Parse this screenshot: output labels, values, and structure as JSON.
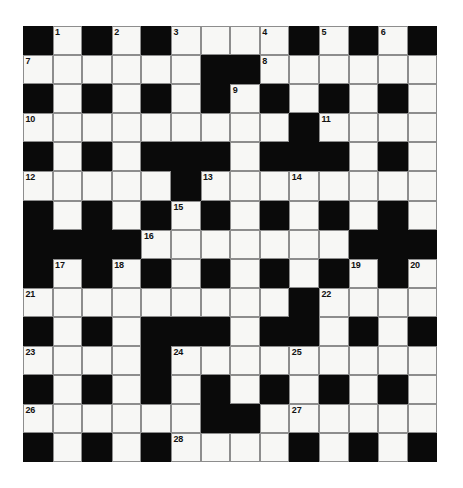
{
  "puzzle": {
    "type": "crossword-grid",
    "title": "",
    "columns": 14,
    "rows": 15,
    "colors": {
      "block": "#0a0a0a",
      "open": "#f7f7f5",
      "grid_line": "#8d8d8d",
      "number_text": "#111111",
      "page_background": "#ffffff"
    },
    "legend": {
      "1": "block (filled black square)",
      "0": "open (white answer square)"
    },
    "grid": [
      [
        1,
        0,
        1,
        0,
        1,
        0,
        0,
        0,
        0,
        1,
        0,
        1,
        0,
        1
      ],
      [
        0,
        0,
        0,
        0,
        0,
        0,
        1,
        1,
        0,
        0,
        0,
        0,
        0,
        0
      ],
      [
        1,
        0,
        1,
        0,
        1,
        0,
        1,
        0,
        1,
        0,
        1,
        0,
        1,
        0
      ],
      [
        0,
        0,
        0,
        0,
        0,
        0,
        0,
        0,
        0,
        1,
        0,
        0,
        0,
        0
      ],
      [
        1,
        0,
        1,
        0,
        1,
        1,
        1,
        0,
        1,
        1,
        1,
        0,
        1,
        0
      ],
      [
        0,
        0,
        0,
        0,
        0,
        1,
        0,
        0,
        0,
        0,
        0,
        0,
        0,
        0
      ],
      [
        1,
        0,
        1,
        0,
        1,
        0,
        1,
        0,
        1,
        0,
        1,
        0,
        1,
        0
      ],
      [
        1,
        1,
        1,
        1,
        0,
        0,
        0,
        0,
        0,
        0,
        0,
        1,
        1,
        1
      ],
      [
        1,
        0,
        1,
        0,
        1,
        0,
        1,
        0,
        1,
        0,
        1,
        0,
        1,
        0
      ],
      [
        0,
        0,
        0,
        0,
        0,
        0,
        0,
        0,
        0,
        1,
        0,
        0,
        0,
        0
      ],
      [
        1,
        0,
        1,
        0,
        1,
        1,
        1,
        0,
        1,
        1,
        0,
        1,
        0,
        1
      ],
      [
        0,
        0,
        0,
        0,
        1,
        0,
        0,
        0,
        0,
        0,
        0,
        0,
        0,
        0
      ],
      [
        1,
        0,
        1,
        0,
        1,
        0,
        1,
        0,
        1,
        0,
        1,
        0,
        1,
        0
      ],
      [
        0,
        0,
        0,
        0,
        0,
        0,
        1,
        1,
        0,
        0,
        0,
        0,
        0,
        0
      ],
      [
        1,
        0,
        1,
        0,
        1,
        0,
        0,
        0,
        0,
        1,
        0,
        1,
        0,
        1
      ]
    ],
    "numbers": [
      {
        "label": "1",
        "row": 0,
        "col": 1
      },
      {
        "label": "2",
        "row": 0,
        "col": 3
      },
      {
        "label": "3",
        "row": 0,
        "col": 5
      },
      {
        "label": "4",
        "row": 0,
        "col": 8
      },
      {
        "label": "5",
        "row": 0,
        "col": 10
      },
      {
        "label": "6",
        "row": 0,
        "col": 12
      },
      {
        "label": "7",
        "row": 1,
        "col": 0
      },
      {
        "label": "8",
        "row": 1,
        "col": 8
      },
      {
        "label": "9",
        "row": 2,
        "col": 7
      },
      {
        "label": "10",
        "row": 3,
        "col": 0
      },
      {
        "label": "11",
        "row": 3,
        "col": 10
      },
      {
        "label": "12",
        "row": 5,
        "col": 0
      },
      {
        "label": "13",
        "row": 5,
        "col": 6
      },
      {
        "label": "14",
        "row": 5,
        "col": 9
      },
      {
        "label": "15",
        "row": 6,
        "col": 5
      },
      {
        "label": "16",
        "row": 7,
        "col": 4
      },
      {
        "label": "17",
        "row": 8,
        "col": 1
      },
      {
        "label": "18",
        "row": 8,
        "col": 3
      },
      {
        "label": "19",
        "row": 8,
        "col": 11
      },
      {
        "label": "20",
        "row": 8,
        "col": 13
      },
      {
        "label": "21",
        "row": 9,
        "col": 0
      },
      {
        "label": "22",
        "row": 9,
        "col": 10
      },
      {
        "label": "23",
        "row": 11,
        "col": 0
      },
      {
        "label": "24",
        "row": 11,
        "col": 5
      },
      {
        "label": "25",
        "row": 11,
        "col": 9
      },
      {
        "label": "26",
        "row": 13,
        "col": 0
      },
      {
        "label": "27",
        "row": 13,
        "col": 9
      },
      {
        "label": "28",
        "row": 14,
        "col": 5
      }
    ]
  }
}
